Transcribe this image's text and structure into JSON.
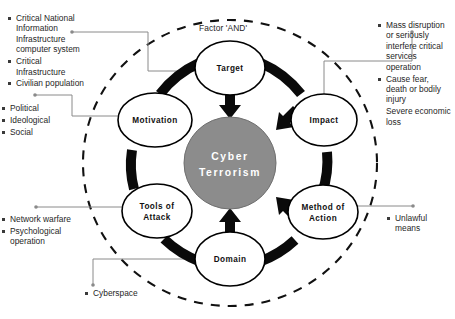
{
  "diagram": {
    "title_label": "Factor 'AND'",
    "core": {
      "line1": "Cyber",
      "line2": "Terrorism",
      "fill": "#8c8c8c",
      "text_color": "#ffffff"
    },
    "nodes": [
      {
        "id": "target",
        "label_line1": "Target",
        "label_line2": ""
      },
      {
        "id": "impact",
        "label_line1": "Impact",
        "label_line2": ""
      },
      {
        "id": "method-of-action",
        "label_line1": "Method of",
        "label_line2": "Action"
      },
      {
        "id": "domain",
        "label_line1": "Domain",
        "label_line2": ""
      },
      {
        "id": "tools-of-attack",
        "label_line1": "Tools of",
        "label_line2": "Attack"
      },
      {
        "id": "motivation",
        "label_line1": "Motivation",
        "label_line2": ""
      }
    ],
    "annotations": [
      {
        "id": "target-annotation",
        "items": [
          "Critical National Information Infrastructure computer system",
          "Critical Infrastructure",
          "Civilian population"
        ]
      },
      {
        "id": "motivation-annotation",
        "items": [
          "Political",
          "Ideological",
          "Social"
        ]
      },
      {
        "id": "tools-of-attack-annotation",
        "items": [
          "Network warfare",
          "Psychological operation"
        ]
      },
      {
        "id": "domain-annotation",
        "items": [
          "Cyberspace"
        ]
      },
      {
        "id": "impact-annotation",
        "items": [
          "Mass disruption or seriously interfere critical services operation",
          "Cause fear, death or bodily injury",
          "Severe economic loss"
        ]
      },
      {
        "id": "method-of-action-annotation",
        "items": [
          "Unlawful means"
        ]
      }
    ],
    "colors": {
      "core_fill": "#8c8c8c",
      "node_fill": "#ffffff",
      "stroke": "#000000",
      "leader_line": "#8a8a8a",
      "text": "#1f1f1f"
    }
  }
}
